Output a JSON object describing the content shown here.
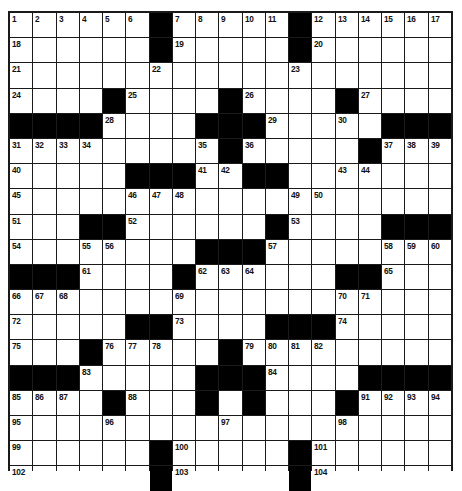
{
  "puzzle": {
    "rows": 19,
    "cols": 19,
    "colors": {
      "block": "#000000",
      "cell": "#ffffff",
      "line": "#1a1a1a",
      "number": "#111111"
    },
    "layout": [
      "......#.....#......",
      "......#.....#......",
      "...................",
      "....#....#....#....",
      "####....###.....###",
      ".........#.....#...",
      ".....###..##.......",
      "...................",
      "...##......#....###",
      "........###........",
      "###....#......##...",
      "...................",
      ".....##....###.....",
      "...#.....#.........",
      "###.....###....####",
      "....#...#.#...#....",
      "...................",
      "......#.....#......",
      "......#.....#......"
    ],
    "numbers": [
      [
        1,
        2,
        3,
        4,
        5,
        6,
        null,
        7,
        8,
        9,
        10,
        11,
        null,
        12,
        13,
        14,
        15,
        16,
        17
      ],
      [
        18,
        null,
        null,
        null,
        null,
        null,
        null,
        19,
        null,
        null,
        null,
        null,
        null,
        20,
        null,
        null,
        null,
        null,
        null
      ],
      [
        21,
        null,
        null,
        null,
        null,
        null,
        22,
        null,
        null,
        null,
        null,
        null,
        23,
        null,
        null,
        null,
        null,
        null,
        null
      ],
      [
        24,
        null,
        null,
        null,
        null,
        25,
        null,
        null,
        null,
        null,
        26,
        null,
        null,
        null,
        null,
        27,
        null,
        null,
        null
      ],
      [
        null,
        null,
        null,
        null,
        28,
        null,
        null,
        null,
        null,
        null,
        null,
        29,
        null,
        null,
        30,
        null,
        null,
        null,
        null
      ],
      [
        31,
        32,
        33,
        34,
        null,
        null,
        null,
        null,
        35,
        null,
        36,
        null,
        null,
        null,
        null,
        null,
        37,
        38,
        39
      ],
      [
        40,
        null,
        null,
        null,
        null,
        null,
        null,
        null,
        41,
        42,
        null,
        null,
        null,
        null,
        43,
        44,
        null,
        null,
        null
      ],
      [
        45,
        null,
        null,
        null,
        null,
        46,
        47,
        48,
        null,
        null,
        null,
        null,
        49,
        50,
        null,
        null,
        null,
        null,
        null
      ],
      [
        51,
        null,
        null,
        null,
        null,
        52,
        null,
        null,
        null,
        null,
        null,
        null,
        53,
        null,
        null,
        null,
        null,
        null,
        null
      ],
      [
        54,
        null,
        null,
        55,
        56,
        null,
        null,
        null,
        null,
        null,
        null,
        57,
        null,
        null,
        null,
        null,
        58,
        59,
        60
      ],
      [
        null,
        null,
        null,
        61,
        null,
        null,
        null,
        null,
        62,
        63,
        64,
        null,
        null,
        null,
        null,
        null,
        65,
        null,
        null
      ],
      [
        66,
        67,
        68,
        null,
        null,
        null,
        null,
        69,
        null,
        null,
        null,
        null,
        null,
        null,
        70,
        71,
        null,
        null,
        null
      ],
      [
        72,
        null,
        null,
        null,
        null,
        null,
        null,
        73,
        null,
        null,
        null,
        null,
        null,
        null,
        74,
        null,
        null,
        null,
        null
      ],
      [
        75,
        null,
        null,
        null,
        76,
        77,
        78,
        null,
        null,
        null,
        79,
        80,
        81,
        82,
        null,
        null,
        null,
        null,
        null
      ],
      [
        null,
        null,
        null,
        83,
        null,
        null,
        null,
        null,
        null,
        null,
        null,
        84,
        null,
        null,
        null,
        null,
        null,
        null,
        null
      ],
      [
        85,
        86,
        87,
        null,
        null,
        88,
        null,
        null,
        89,
        null,
        90,
        null,
        null,
        null,
        null,
        91,
        92,
        93,
        94
      ],
      [
        95,
        null,
        null,
        null,
        96,
        null,
        null,
        null,
        null,
        97,
        null,
        null,
        null,
        null,
        98,
        null,
        null,
        null,
        null
      ],
      [
        99,
        null,
        null,
        null,
        null,
        null,
        null,
        100,
        null,
        null,
        null,
        null,
        null,
        101,
        null,
        null,
        null,
        null,
        null
      ],
      [
        102,
        null,
        null,
        null,
        null,
        null,
        null,
        103,
        null,
        null,
        null,
        null,
        null,
        104,
        null,
        null,
        null,
        null,
        null
      ]
    ],
    "letters": []
  }
}
